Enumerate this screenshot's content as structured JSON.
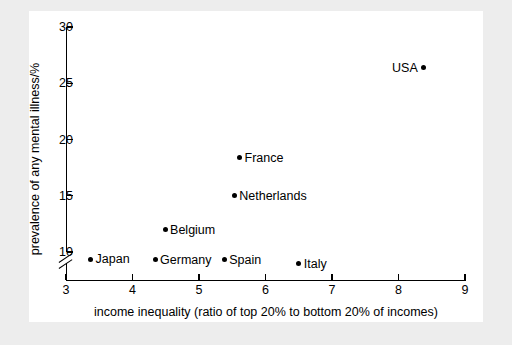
{
  "chart_data": {
    "type": "scatter",
    "title": "",
    "xlabel": "income inequality (ratio of top 20% to bottom 20% of incomes)",
    "ylabel": "prevalence of any mental illness/%",
    "xlim": [
      3,
      9
    ],
    "ylim": [
      8,
      30
    ],
    "xticks": [
      "3",
      "4",
      "5",
      "6",
      "7",
      "8",
      "9"
    ],
    "yticks": [
      "10",
      "15",
      "20",
      "25",
      "30"
    ],
    "grid": false,
    "legend": "none",
    "y_axis_break": true,
    "points": [
      {
        "label": "Japan",
        "x": 3.37,
        "y": 9.35,
        "label_side": "right"
      },
      {
        "label": "Germany",
        "x": 4.34,
        "y": 9.3,
        "label_side": "right"
      },
      {
        "label": "Spain",
        "x": 5.38,
        "y": 9.33,
        "label_side": "right"
      },
      {
        "label": "Italy",
        "x": 6.5,
        "y": 8.95,
        "label_side": "right"
      },
      {
        "label": "Belgium",
        "x": 4.49,
        "y": 12.0,
        "label_side": "right"
      },
      {
        "label": "Netherlands",
        "x": 5.53,
        "y": 15.0,
        "label_side": "right"
      },
      {
        "label": "France",
        "x": 5.61,
        "y": 18.4,
        "label_side": "right"
      },
      {
        "label": "USA",
        "x": 8.38,
        "y": 26.4,
        "label_side": "left"
      }
    ]
  },
  "colors": {
    "marker": "#000000",
    "axis": "#000000",
    "plot_background": "#ffffff",
    "figure_background": "#ededed"
  }
}
